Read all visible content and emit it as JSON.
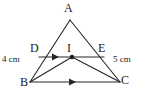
{
  "figure": {
    "type": "geometry-diagram",
    "background_color": "#ffffff",
    "stroke_color": "#262626",
    "text_color": "#1a1a1a",
    "vertices": [
      {
        "id": "A",
        "label": "A",
        "x": 70,
        "y": 18
      },
      {
        "id": "B",
        "label": "B",
        "x": 30,
        "y": 82
      },
      {
        "id": "C",
        "label": "C",
        "x": 120,
        "y": 82
      },
      {
        "id": "D",
        "label": "D",
        "x": 42,
        "y": 57
      },
      {
        "id": "E",
        "label": "E",
        "x": 101,
        "y": 57
      },
      {
        "id": "I",
        "label": "I",
        "x": 72,
        "y": 57
      }
    ],
    "segments": [
      {
        "from": "A",
        "to": "B",
        "name": "side-AB"
      },
      {
        "from": "A",
        "to": "C",
        "name": "side-AC"
      },
      {
        "from": "B",
        "to": "C",
        "name": "side-BC",
        "marker": "single-arrow"
      },
      {
        "from": "D",
        "to": "E",
        "name": "segment-DE",
        "marker": "single-arrow"
      },
      {
        "from": "B",
        "to": "I",
        "name": "segment-BI"
      },
      {
        "from": "C",
        "to": "I",
        "name": "segment-CI"
      }
    ],
    "points_marked": [
      {
        "id": "I",
        "style": "filled-dot"
      }
    ],
    "measures": [
      {
        "id": "bd",
        "label": "4 cm",
        "applies_to": "BD"
      },
      {
        "id": "ec",
        "label": "5 cm",
        "applies_to": "EC"
      }
    ],
    "parallel_mark_note": "DE and BC each carry one arrowhead indicating DE is parallel to BC"
  }
}
